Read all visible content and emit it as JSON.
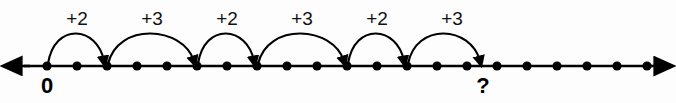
{
  "figure": {
    "background_color": "#fdfdfd",
    "stroke_color": "#000000"
  },
  "chart_data": {
    "type": "line",
    "xlabel": "",
    "ylabel": "",
    "axis": {
      "orientation": "horizontal",
      "left_arrow": true,
      "right_arrow": true,
      "x_start_px": 18,
      "x_end_px": 658,
      "y_px": 66,
      "tick_spacing_px": 30,
      "tick_count": 21,
      "first_tick_x_px": 47,
      "tick_style": "filled-dot",
      "grid": false,
      "legend": false
    },
    "tick_indices": [
      0,
      1,
      2,
      3,
      4,
      5,
      6,
      7,
      8,
      9,
      10,
      11,
      12,
      13,
      14,
      15,
      16,
      17,
      18,
      19,
      20
    ],
    "point_labels": [
      {
        "index": 0,
        "text": "0",
        "x_px": 47
      },
      {
        "index": 15,
        "text": "?",
        "x_px": 483
      }
    ],
    "jumps": [
      {
        "label": "+2",
        "value": 2,
        "from_index": 0,
        "to_index": 2,
        "from_x_px": 47,
        "to_x_px": 107,
        "label_x_px": 77,
        "label_y_px": 25
      },
      {
        "label": "+3",
        "value": 3,
        "from_index": 2,
        "to_index": 5,
        "from_x_px": 107,
        "to_x_px": 197,
        "label_x_px": 152,
        "label_y_px": 25
      },
      {
        "label": "+2",
        "value": 2,
        "from_index": 5,
        "to_index": 7,
        "from_x_px": 197,
        "to_x_px": 257,
        "label_x_px": 227,
        "label_y_px": 25
      },
      {
        "label": "+3",
        "value": 3,
        "from_index": 7,
        "to_index": 10,
        "from_x_px": 257,
        "to_x_px": 347,
        "label_x_px": 302,
        "label_y_px": 25
      },
      {
        "label": "+2",
        "value": 2,
        "from_index": 10,
        "to_index": 12,
        "from_x_px": 347,
        "to_x_px": 407,
        "label_x_px": 377,
        "label_y_px": 25
      },
      {
        "label": "+3",
        "value": 3,
        "from_index": 12,
        "to_index": 15,
        "from_x_px": 407,
        "to_x_px": 483,
        "label_x_px": 452,
        "label_y_px": 25
      }
    ],
    "sequence_values": [
      0,
      2,
      5,
      7,
      10,
      12,
      15
    ],
    "answer_value": 15
  }
}
